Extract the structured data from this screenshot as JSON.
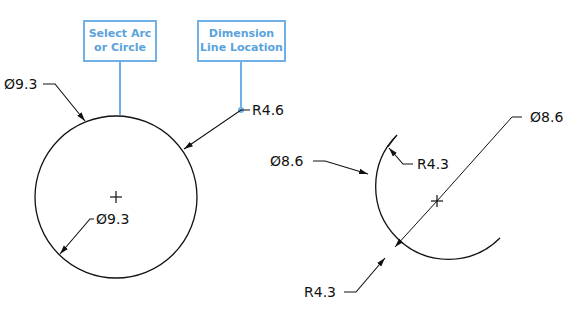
{
  "callouts": {
    "select": {
      "line1": "Select Arc",
      "line2": "or Circle"
    },
    "location": {
      "line1": "Dimension",
      "line2": "Line Location"
    }
  },
  "left_circle": {
    "labels": {
      "outer_diameter": "Ø9.3",
      "radius": "R4.6",
      "inner_diameter": "Ø9.3"
    }
  },
  "right_arc": {
    "labels": {
      "left_diameter": "Ø8.6",
      "top_radius": "R4.3",
      "right_diameter": "Ø8.6",
      "bottom_radius": "R4.3"
    }
  },
  "colors": {
    "callout": "#6fb1e6",
    "line": "#111111"
  }
}
